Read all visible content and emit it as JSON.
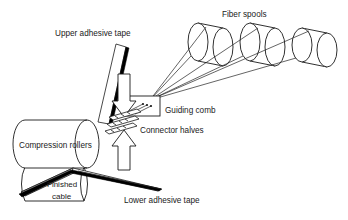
{
  "diagram": {
    "background_color": "#ffffff",
    "line_color": "#1a1a1a",
    "accent_color": "#000000",
    "width": 348,
    "height": 220,
    "labels": {
      "fiber_spools": "Fiber spools",
      "upper_adhesive_tape": "Upper adhesive tape",
      "guiding_comb": "Guiding comb",
      "connector_halves": "Connector halves",
      "compression_rollers": "Compression rollers",
      "finished_cable_line1": "Finished",
      "finished_cable_line2": "cable",
      "lower_adhesive_tape": "Lower adhesive tape"
    },
    "components": [
      {
        "name": "fiber-spool-1",
        "type": "cylinder",
        "label": "Fiber spool 1",
        "cx": 198,
        "cy": 42,
        "rx": 10,
        "ry": 19,
        "depth": 25
      },
      {
        "name": "fiber-spool-2",
        "type": "cylinder",
        "label": "Fiber spool 2",
        "cx": 250,
        "cy": 42,
        "rx": 10,
        "ry": 19,
        "depth": 25
      },
      {
        "name": "fiber-spool-3",
        "type": "cylinder",
        "label": "Fiber spool 3",
        "cx": 302,
        "cy": 45,
        "rx": 10,
        "ry": 17,
        "depth": 25
      },
      {
        "name": "guiding-comb",
        "type": "box",
        "label": "Guiding comb",
        "x": 124,
        "y": 96,
        "width": 36,
        "height": 20
      },
      {
        "name": "connector-halves",
        "type": "plate-stack",
        "label": "Connector halves",
        "count": 3
      },
      {
        "name": "compression-roller-upper",
        "type": "cylinder",
        "label": "Upper compression roller"
      },
      {
        "name": "compression-roller-lower",
        "type": "cylinder",
        "label": "Lower compression roller"
      },
      {
        "name": "upper-adhesive-tape",
        "type": "strip",
        "label": "Upper adhesive tape"
      },
      {
        "name": "lower-adhesive-tape",
        "type": "strip",
        "label": "Lower adhesive tape"
      },
      {
        "name": "finished-cable",
        "type": "strip",
        "label": "Finished cable"
      },
      {
        "name": "press-arrow-down",
        "type": "arrow",
        "label": "Downward pressing arrow",
        "direction": "down"
      },
      {
        "name": "press-arrow-up",
        "type": "arrow",
        "label": "Upward pressing arrow",
        "direction": "up"
      }
    ],
    "fiber_paths": [
      {
        "name": "fiber-line-spool1-a",
        "from_spool": 1
      },
      {
        "name": "fiber-line-spool1-b",
        "from_spool": 1
      },
      {
        "name": "fiber-line-spool2-a",
        "from_spool": 2
      },
      {
        "name": "fiber-line-spool2-b",
        "from_spool": 2
      },
      {
        "name": "fiber-line-spool3-a",
        "from_spool": 3
      },
      {
        "name": "fiber-line-spool3-b",
        "from_spool": 3
      }
    ]
  }
}
